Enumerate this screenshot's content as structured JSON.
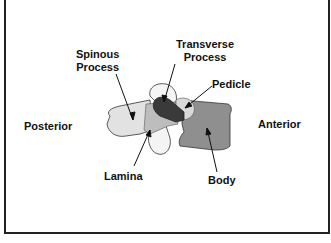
{
  "diagram": {
    "orientation": {
      "left": "Posterior",
      "right": "Anterior"
    },
    "labels": {
      "spinous_process": "Spinous Process",
      "spinous_line1": "Spinous",
      "spinous_line2": "Process",
      "transverse_line1": "Transverse",
      "transverse_line2": "Process",
      "pedicle": "Pedicle",
      "lamina": "Lamina",
      "body": "Body"
    },
    "colors": {
      "background": "#ffffff",
      "border": "#222222",
      "spinous_process": "#e2e2e2",
      "lamina": "#bdbdbd",
      "transverse_process": "#3a3a3a",
      "pedicle": "#d9d9d9",
      "body": "#8f8f8f",
      "articular_process": "#f4f4f4",
      "text": "#111111"
    }
  }
}
